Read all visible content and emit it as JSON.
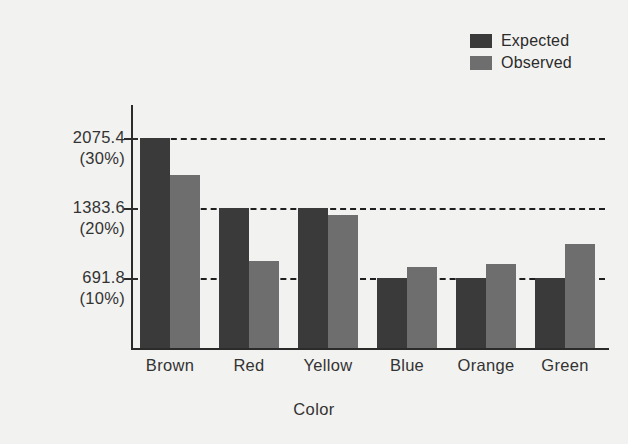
{
  "chart_data": {
    "type": "bar",
    "title": "",
    "xlabel": "Color",
    "ylabel": "Count",
    "categories": [
      "Brown",
      "Red",
      "Yellow",
      "Blue",
      "Orange",
      "Green"
    ],
    "series": [
      {
        "name": "Expected",
        "color": "#3a3a3a",
        "values": [
          2075.4,
          1383.6,
          1383.6,
          691.8,
          691.8,
          691.8
        ]
      },
      {
        "name": "Observed",
        "color": "#6e6e6e",
        "values": [
          1710,
          864,
          1311,
          800,
          830,
          1030
        ]
      }
    ],
    "ylim": [
      0,
      2380
    ],
    "grid": true,
    "gridlines": [
      {
        "value": 691.8,
        "label": "691.8",
        "sublabel": "(10%)"
      },
      {
        "value": 1383.6,
        "label": "1383.6",
        "sublabel": "(20%)"
      },
      {
        "value": 2075.4,
        "label": "2075.4",
        "sublabel": "(30%)"
      }
    ],
    "yticks": [
      "691.8",
      "1383.6",
      "2075.4"
    ],
    "ytick_sublabels": [
      "(10%)",
      "(20%)",
      "(30%)"
    ],
    "legend_position": "top-right"
  },
  "legend": {
    "entries": [
      {
        "label": "Expected",
        "color": "#3a3a3a"
      },
      {
        "label": "Observed",
        "color": "#6e6e6e"
      }
    ]
  },
  "axes": {
    "y_title": "Count",
    "x_title": "Color"
  },
  "colors": {
    "background": "#f2f2f0",
    "axis": "#2b2b2b",
    "text": "#333333",
    "expected_bar": "#3a3a3a",
    "observed_bar": "#6e6e6e",
    "gridline": "#1f1f1f"
  }
}
